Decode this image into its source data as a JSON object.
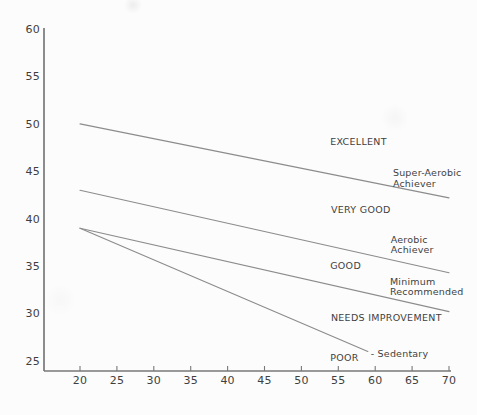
{
  "chart_data": {
    "type": "line",
    "title": "",
    "xlabel": "",
    "ylabel": "",
    "xlim": [
      20,
      70
    ],
    "ylim": [
      25,
      60
    ],
    "x_ticks": [
      20,
      25,
      30,
      35,
      40,
      45,
      50,
      55,
      60,
      65,
      70
    ],
    "y_ticks": [
      60,
      55,
      50,
      45,
      40,
      35,
      30,
      25
    ],
    "grid": "off",
    "legend": "none",
    "series": [
      {
        "name": "Super-Aerobic Achiever",
        "points": [
          [
            20,
            50
          ],
          [
            70,
            42.2
          ]
        ]
      },
      {
        "name": "Aerobic Achiever",
        "points": [
          [
            20,
            43
          ],
          [
            70,
            34.3
          ]
        ]
      },
      {
        "name": "Minimum Recommended",
        "points": [
          [
            20,
            39
          ],
          [
            70,
            30.2
          ]
        ]
      },
      {
        "name": "Sedentary",
        "points": [
          [
            20,
            39
          ],
          [
            59,
            26
          ]
        ]
      }
    ],
    "zone_labels": [
      {
        "text": "EXCELLENT",
        "x": 53.9,
        "y": 48.1
      },
      {
        "text": "VERY GOOD",
        "x": 54.0,
        "y": 40.9
      },
      {
        "text": "GOOD",
        "x": 53.9,
        "y": 35.0
      },
      {
        "text": "NEEDS IMPROVEMENT",
        "x": 54.0,
        "y": 29.6
      },
      {
        "text": "POOR",
        "x": 53.9,
        "y": 25.4
      }
    ],
    "line_labels": [
      {
        "lines": [
          "Super-Aerobic",
          "Achiever"
        ],
        "x": 62.4,
        "y": 44.8
      },
      {
        "lines": [
          "Aerobic",
          "Achiever"
        ],
        "x": 62.1,
        "y": 37.8
      },
      {
        "lines": [
          "Minimum",
          "Recommended"
        ],
        "x": 62.0,
        "y": 33.4
      },
      {
        "lines": [
          "- Sedentary"
        ],
        "x": 59.4,
        "y": 25.8
      }
    ]
  },
  "colors": {
    "background": "#fcfcfc",
    "axis": "#787878",
    "series_line": "#8c8c8c",
    "text": "#3f3f3f"
  }
}
